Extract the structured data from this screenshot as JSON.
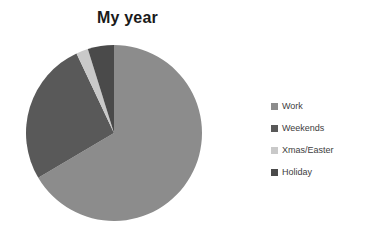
{
  "chart_data": {
    "type": "pie",
    "title": "My year",
    "categories": [
      "Work",
      "Weekends",
      "Xmas/Easter",
      "Holiday"
    ],
    "values": [
      66.5,
      26.5,
      2.2,
      4.8
    ],
    "units": "percent",
    "colors": [
      "#8c8c8c",
      "#595959",
      "#c9c9c9",
      "#4a4a4a"
    ],
    "legend_position": "right",
    "grid": false,
    "xlabel": "",
    "ylabel": "",
    "slices": [
      {
        "label": "Work",
        "value": 66.5,
        "color": "#8c8c8c",
        "start_angle": 0.0,
        "end_angle": 239.4
      },
      {
        "label": "Weekends",
        "value": 26.5,
        "color": "#595959",
        "start_angle": 239.4,
        "end_angle": 334.8
      },
      {
        "label": "Xmas/Easter",
        "value": 2.2,
        "color": "#c9c9c9",
        "start_angle": 334.8,
        "end_angle": 342.7
      },
      {
        "label": "Holiday",
        "value": 4.8,
        "color": "#4a4a4a",
        "start_angle": 342.7,
        "end_angle": 360.0
      }
    ]
  },
  "legend": {
    "items": [
      {
        "label": "Work",
        "color": "#8c8c8c"
      },
      {
        "label": "Weekends",
        "color": "#595959"
      },
      {
        "label": "Xmas/Easter",
        "color": "#c9c9c9"
      },
      {
        "label": "Holiday",
        "color": "#4a4a4a"
      }
    ]
  },
  "canvas": {
    "background": "#ffffff",
    "title_color": "#1a1a1a",
    "legend_text_color": "#3d3d3d"
  }
}
